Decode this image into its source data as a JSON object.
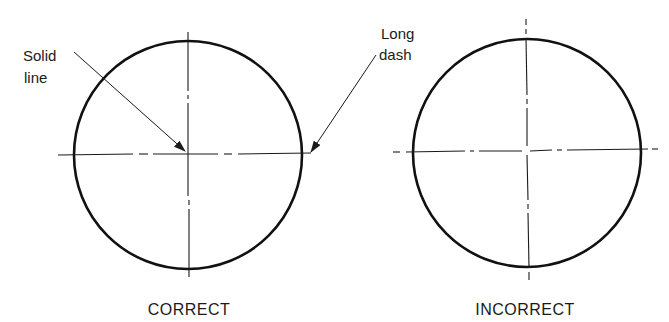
{
  "figure": {
    "panels": [
      {
        "id": "correct",
        "caption": "CORRECT",
        "circle": {
          "cx": 188,
          "cy": 155,
          "r": 114
        },
        "note": "Center lines cross at solid line segments (long dashes) at the center; line ends extend slightly beyond the circle with long dash"
      },
      {
        "id": "incorrect",
        "caption": "INCORRECT",
        "circle": {
          "cx": 527,
          "cy": 152,
          "r": 115
        },
        "note": "Center lines cross at gaps/short dashes; line ends beyond circle terminate in short dashes"
      }
    ],
    "callouts": {
      "solid_line": {
        "line1": "Solid",
        "line2": "line"
      },
      "long_dash": {
        "line1": "Long",
        "line2": "dash"
      }
    },
    "colors": {
      "ink": "#111111",
      "background": "#ffffff"
    }
  }
}
